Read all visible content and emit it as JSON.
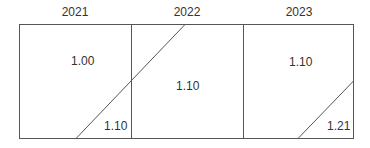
{
  "headers": [
    "2021",
    "2022",
    "2023"
  ],
  "cells": {
    "c2021_top": "1.00",
    "c2021_bottom": "1.10",
    "c2022_mid": "1.10",
    "c2023_top": "1.10",
    "c2023_bottom": "1.21"
  },
  "colors": {
    "line": "#555555",
    "text": "#333333"
  }
}
